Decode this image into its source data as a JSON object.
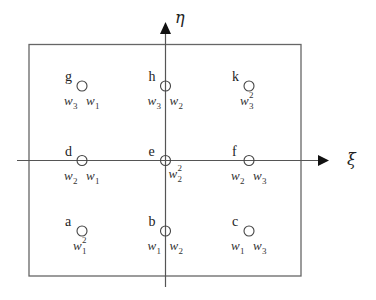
{
  "diagram": {
    "type": "gauss-quadrature-grid",
    "axes": {
      "horizontal_label": "ξ",
      "vertical_label": "η"
    },
    "points": [
      {
        "id": "g",
        "label": "g",
        "col": 0,
        "row": 0,
        "weight": [
          {
            "w": "w",
            "sub": "3"
          },
          {
            "w": "w",
            "sub": "1"
          }
        ]
      },
      {
        "id": "h",
        "label": "h",
        "col": 1,
        "row": 0,
        "weight": [
          {
            "w": "w",
            "sub": "3"
          },
          {
            "w": "w",
            "sub": "2"
          }
        ]
      },
      {
        "id": "k",
        "label": "k",
        "col": 2,
        "row": 0,
        "weight": [
          {
            "w": "w",
            "sub": "3",
            "sup": "2"
          }
        ]
      },
      {
        "id": "d",
        "label": "d",
        "col": 0,
        "row": 1,
        "weight": [
          {
            "w": "w",
            "sub": "2"
          },
          {
            "w": "w",
            "sub": "1"
          }
        ]
      },
      {
        "id": "e",
        "label": "e",
        "col": 1,
        "row": 1,
        "weight": [
          {
            "w": "w",
            "sub": "2",
            "sup": "2"
          }
        ]
      },
      {
        "id": "f",
        "label": "f",
        "col": 2,
        "row": 1,
        "weight": [
          {
            "w": "w",
            "sub": "2"
          },
          {
            "w": "w",
            "sub": "3"
          }
        ]
      },
      {
        "id": "a",
        "label": "a",
        "col": 0,
        "row": 2,
        "weight": [
          {
            "w": "w",
            "sub": "1",
            "sup": "2"
          }
        ]
      },
      {
        "id": "b",
        "label": "b",
        "col": 1,
        "row": 2,
        "weight": [
          {
            "w": "w",
            "sub": "1"
          },
          {
            "w": "w",
            "sub": "2"
          }
        ]
      },
      {
        "id": "c",
        "label": "c",
        "col": 2,
        "row": 2,
        "weight": [
          {
            "w": "w",
            "sub": "1"
          },
          {
            "w": "w",
            "sub": "3"
          }
        ]
      }
    ],
    "colors": {
      "stroke": "#555555",
      "text": "#222222"
    }
  }
}
